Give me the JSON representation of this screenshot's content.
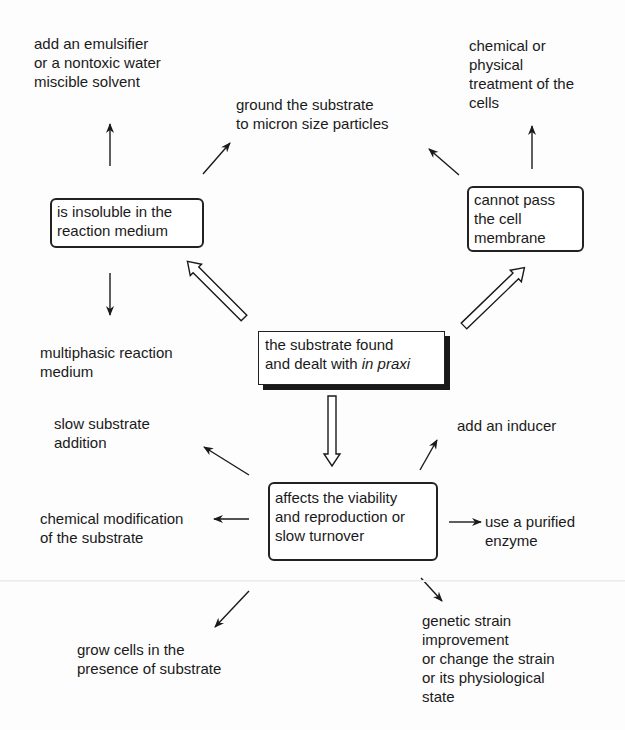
{
  "diagram": {
    "center": {
      "line1": "the substrate found",
      "line2_prefix": "and dealt with ",
      "line2_italic": "in praxi"
    },
    "problems": [
      {
        "id": "insoluble",
        "text": "is insoluble in the\nreaction medium"
      },
      {
        "id": "membrane",
        "text": "cannot pass\nthe cell\nmembrane"
      },
      {
        "id": "viability",
        "text": "affects the viability\nand reproduction or\nslow turnover"
      }
    ],
    "outcomes": {
      "emulsifier": "add an emulsifier\nor a nontoxic water\nmiscible solvent",
      "ground": "ground the substrate\nto micron size particles",
      "multiphasic": "multiphasic reaction\nmedium",
      "chemical_treatment": "chemical or\nphysical\ntreatment of the\ncells",
      "slow_addition": "slow substrate\naddition",
      "chemical_modification": "chemical modification\nof the substrate",
      "grow_cells": "grow cells in the\npresence of substrate",
      "inducer": "add an inducer",
      "purified_enzyme": "use a purified\nenzyme",
      "genetic_strain": "genetic strain\nimprovement\nor change the strain\nor its physiological\nstate"
    },
    "colors": {
      "ink": "#1a1a1a",
      "background": "#fdfdfd"
    }
  }
}
